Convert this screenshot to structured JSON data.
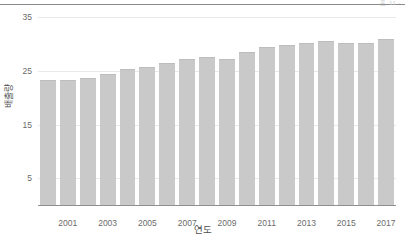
{
  "header": {
    "fragment_text": "표 11 -"
  },
  "axes": {
    "y_label": "배출량",
    "x_label": "연도",
    "y_ticks": [
      "5",
      "15",
      "25",
      "35"
    ],
    "x_ticks": [
      "2001",
      "2003",
      "2005",
      "2007",
      "2009",
      "2011",
      "2013",
      "2015",
      "2017"
    ]
  },
  "colors": {
    "bar": "#c9c9c9",
    "grid": "#e9e9e9",
    "axis": "#8f8f8f",
    "text": "#6b6b6b"
  },
  "chart_data": {
    "type": "bar",
    "title": "",
    "xlabel": "연도",
    "ylabel": "배출량",
    "ylim": [
      0,
      36
    ],
    "grid": true,
    "legend": "none",
    "yticks": [
      5,
      15,
      25,
      35
    ],
    "categories": [
      "2000",
      "2001",
      "2002",
      "2003",
      "2004",
      "2005",
      "2006",
      "2007",
      "2008",
      "2009",
      "2010",
      "2011",
      "2012",
      "2013",
      "2014",
      "2015",
      "2016",
      "2017"
    ],
    "labeled_categories": [
      "2001",
      "2003",
      "2005",
      "2007",
      "2009",
      "2011",
      "2013",
      "2015",
      "2017"
    ],
    "values": [
      23.4,
      23.4,
      23.6,
      24.5,
      25.3,
      25.8,
      26.4,
      27.3,
      27.6,
      27.2,
      28.5,
      29.5,
      29.9,
      30.2,
      30.6,
      30.2,
      30.2,
      31.0
    ]
  }
}
